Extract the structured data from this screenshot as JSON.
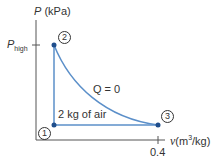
{
  "diagram": {
    "type": "P-v process diagram",
    "y_axis": {
      "symbol": "P",
      "unit": "(kPa)",
      "tick_label_symbol": "P",
      "tick_label_sub": "high"
    },
    "x_axis": {
      "symbol": "v",
      "unit_prefix": "(m",
      "unit_sup": "3",
      "unit_suffix": "/kg)",
      "tick_label": "0.4"
    },
    "states": [
      {
        "id": "1",
        "label": "1"
      },
      {
        "id": "2",
        "label": "2"
      },
      {
        "id": "3",
        "label": "3"
      }
    ],
    "annotations": {
      "process_2_3": "Q = 0",
      "mass": "2 kg of air"
    },
    "colors": {
      "process_line": "#5b8fc9",
      "state_point": "#1f4e8c",
      "axis": "#555555",
      "text": "#333333"
    }
  }
}
